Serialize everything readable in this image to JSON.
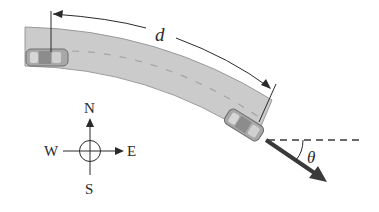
{
  "figure": {
    "labels": {
      "distance": "d",
      "angle": "θ"
    },
    "compass": {
      "north": "N",
      "south": "S",
      "east": "E",
      "west": "W"
    },
    "colors": {
      "road": "#c9c9c9",
      "road_edge": "#8e8e8e",
      "lane_dash": "#a9a9a9",
      "car": "#9d9d9d",
      "ink": "#2a2a2a",
      "arrow": "#3a3a3a"
    }
  }
}
